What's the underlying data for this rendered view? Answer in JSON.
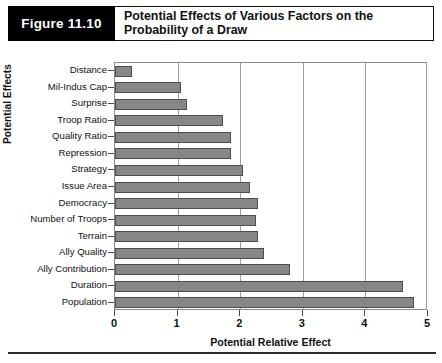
{
  "figure": {
    "number_label": "Figure 11.10",
    "title": "Potential Effects of Various Factors on the Probability of a Draw"
  },
  "chart_data": {
    "type": "bar",
    "orientation": "horizontal",
    "title": "Potential Effects of Various Factors on the Probability of a Draw",
    "xlabel": "Potential Relative Effect",
    "ylabel": "Potential Effects",
    "xlim": [
      0,
      5
    ],
    "xticks": [
      "0",
      "1",
      "2",
      "3",
      "4",
      "5"
    ],
    "grid": "vertical",
    "legend": "none",
    "bar_color": "#878787",
    "bar_edge_color": "#4d4d4d",
    "categories": [
      "Distance",
      "Mil-Indus Cap",
      "Surprise",
      "Troop Ratio",
      "Quality Ratio",
      "Repression",
      "Strategy",
      "Issue Area",
      "Democracy",
      "Number of Troops",
      "Terrain",
      "Ally Quality",
      "Ally Contribution",
      "Duration",
      "Population"
    ],
    "values": [
      0.27,
      1.05,
      1.15,
      1.72,
      1.85,
      1.85,
      2.05,
      2.15,
      2.28,
      2.25,
      2.28,
      2.38,
      2.8,
      4.6,
      4.78
    ]
  }
}
